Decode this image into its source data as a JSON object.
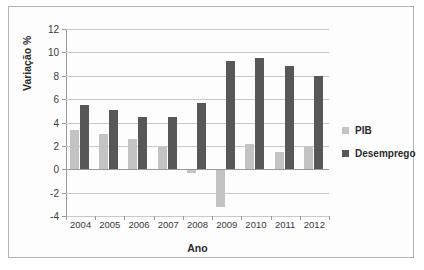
{
  "chart_data": {
    "type": "bar",
    "title": "",
    "xlabel": "Ano",
    "ylabel": "Variação %",
    "categories": [
      "2004",
      "2005",
      "2006",
      "2007",
      "2008",
      "2009",
      "2010",
      "2011",
      "2012"
    ],
    "series": [
      {
        "name": "PIB",
        "color": "#c3c3c3",
        "values": [
          3.4,
          3.0,
          2.6,
          1.9,
          -0.3,
          -3.2,
          2.2,
          1.5,
          2.0
        ]
      },
      {
        "name": "Desemprego",
        "color": "#575757",
        "values": [
          5.5,
          5.1,
          4.5,
          4.5,
          5.7,
          9.3,
          9.5,
          8.8,
          8.0
        ]
      }
    ],
    "ylim": [
      -4,
      12
    ],
    "yticks": [
      12,
      10,
      8,
      6,
      4,
      2,
      0,
      -2,
      -4
    ],
    "ytick_labels": [
      "12",
      "10",
      "8",
      "6",
      "4",
      "2",
      "0",
      "-2",
      "-4"
    ],
    "grid": true,
    "legend_position": "right"
  },
  "legend": {
    "items": [
      {
        "label": "PIB"
      },
      {
        "label": "Desemprego"
      }
    ]
  },
  "axes": {
    "x_title": "Ano",
    "y_title": "Variação %"
  }
}
